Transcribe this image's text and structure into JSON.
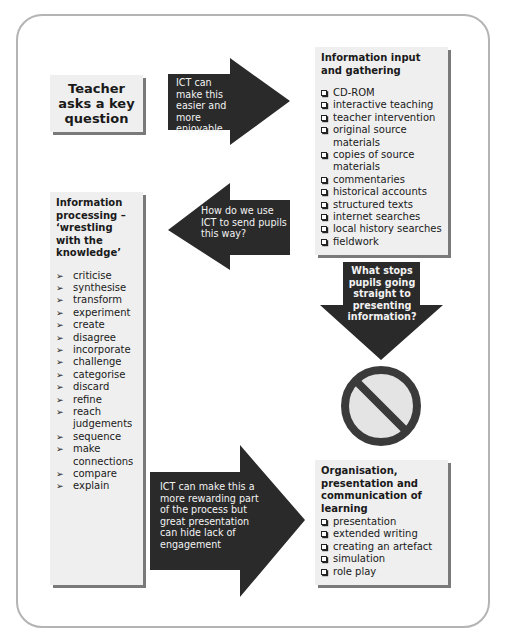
{
  "colors": {
    "frame_border": "#b4b4b4",
    "box_fill": "#efefef",
    "box_shadow": "#7a7a7a",
    "arrow_fill": "#2a2a2a",
    "arrow_text": "#f2f2f2",
    "no_entry_ring": "#3a3a3a",
    "no_entry_fill": "#e4e4e4"
  },
  "teacher_box": {
    "text": "Teacher asks a key question"
  },
  "input_box": {
    "title": "Information input and gathering",
    "bullet_icon": "checkbox-icon",
    "items": [
      "CD-ROM",
      "interactive teaching",
      "teacher intervention",
      "original source materials",
      "copies of source materials",
      "commentaries",
      "historical accounts",
      "structured texts",
      "internet searches",
      "local history searches",
      "fieldwork"
    ]
  },
  "processing_box": {
    "title": "Information processing – ‘wrestling with the knowledge’",
    "bullet_icon": "arrowhead-icon",
    "bullet_glyph": "➢",
    "items": [
      "criticise",
      "synthesise",
      "transform",
      "experiment",
      "create",
      "disagree",
      "incorporate",
      "challenge",
      "categorise",
      "discard",
      "refine",
      "reach judgements",
      "sequence",
      "make connections",
      "compare",
      "explain"
    ]
  },
  "output_box": {
    "title": "Organisation, presentation and communication of learning",
    "bullet_icon": "checkbox-icon",
    "items": [
      "presentation",
      "extended writing",
      "creating an artefact",
      "simulation",
      "role play"
    ]
  },
  "arrows": {
    "to_input": {
      "direction": "right",
      "text": "ICT can make this easier and more enjoyable"
    },
    "to_processing": {
      "direction": "left",
      "text": "How do we use ICT to send pupils this way?"
    },
    "to_stop": {
      "direction": "down",
      "text": "What stops pupils going straight to presenting information?"
    },
    "to_output": {
      "direction": "right",
      "text": "ICT can make this a more rewarding part of the process but great presentation can hide lack of engagement"
    }
  },
  "no_entry_sign": {
    "icon": "no-entry-icon"
  }
}
